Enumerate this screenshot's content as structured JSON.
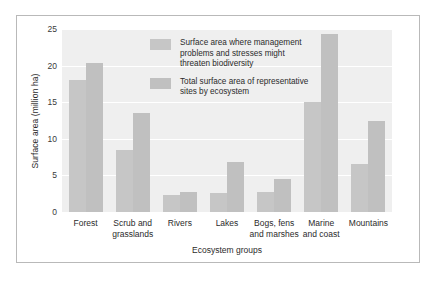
{
  "chart_data": {
    "type": "bar",
    "title": "",
    "xlabel": "Ecosystem groups",
    "ylabel": "Surface area (million ha)",
    "ylim": [
      0,
      25
    ],
    "yticks": [
      0,
      5,
      10,
      15,
      20,
      25
    ],
    "grid": true,
    "legend_position": "inside-top-center",
    "categories": [
      "Forest",
      "Scrub and grasslands",
      "Rivers",
      "Lakes",
      "Bogs, fens and marshes",
      "Marine and coast",
      "Mountains"
    ],
    "category_lines": [
      [
        "Forest"
      ],
      [
        "Scrub and",
        "grasslands"
      ],
      [
        "Rivers"
      ],
      [
        "Lakes"
      ],
      [
        "Bogs, fens",
        "and marshes"
      ],
      [
        "Marine",
        "and coast"
      ],
      [
        "Mountains"
      ]
    ],
    "series": [
      {
        "name": "Surface area where management problems and stresses might threaten biodiversity",
        "name_lines": [
          "Surface area where management",
          "problems and stresses might",
          "threaten biodiversity"
        ],
        "color": "#c6c6c6",
        "values": [
          18.0,
          8.5,
          2.3,
          2.6,
          2.7,
          15.0,
          6.5
        ]
      },
      {
        "name": "Total surface area of representative sites by ecosystem",
        "name_lines": [
          "Total surface area of representative",
          "sites by ecosystem"
        ],
        "color": "#c0c0c0",
        "values": [
          20.3,
          13.5,
          2.7,
          6.8,
          4.5,
          24.3,
          12.4
        ]
      }
    ],
    "plot_background": "#efefef",
    "gridline_color": "#ffffff",
    "frame_color": "#b9b9b9"
  }
}
